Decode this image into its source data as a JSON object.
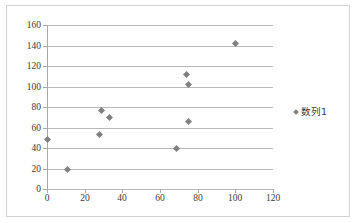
{
  "chart_data": {
    "type": "scatter",
    "title": "",
    "xlabel": "",
    "ylabel": "",
    "xlim": [
      0,
      120
    ],
    "ylim": [
      0,
      160
    ],
    "xticks": [
      0,
      20,
      40,
      60,
      80,
      100,
      120
    ],
    "yticks": [
      0,
      20,
      40,
      60,
      80,
      100,
      120,
      140,
      160
    ],
    "grid": "horizontal",
    "legend_position": "right",
    "marker": "diamond",
    "marker_color": "#808080",
    "gridline_color": "#b8b8b8",
    "series": [
      {
        "name": "数列1",
        "points": [
          {
            "x": 0,
            "y": 48
          },
          {
            "x": 11,
            "y": 19
          },
          {
            "x": 28,
            "y": 53
          },
          {
            "x": 29,
            "y": 77
          },
          {
            "x": 33,
            "y": 70
          },
          {
            "x": 69,
            "y": 40
          },
          {
            "x": 74,
            "y": 112
          },
          {
            "x": 75,
            "y": 102
          },
          {
            "x": 75,
            "y": 66
          },
          {
            "x": 100,
            "y": 142
          }
        ]
      }
    ]
  },
  "legend": {
    "entries": [
      {
        "label": "数列1"
      }
    ]
  }
}
